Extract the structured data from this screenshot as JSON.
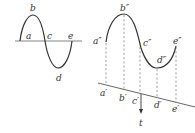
{
  "diagram": {
    "colors": {
      "stroke": "#333333",
      "axis": "#666666",
      "background": "#ffffff"
    },
    "left_panel": {
      "labels": {
        "a": "a",
        "b": "b",
        "c": "c",
        "d": "d",
        "e": "e"
      }
    },
    "right_panel": {
      "curve_labels": {
        "a": "a″",
        "b": "b″",
        "c": "c″",
        "d": "d″",
        "e": "e″"
      },
      "axis_labels": {
        "a": "a′",
        "b": "b′",
        "c": "c′",
        "d": "d′",
        "e": "e′"
      },
      "arrow_label": "t"
    }
  }
}
